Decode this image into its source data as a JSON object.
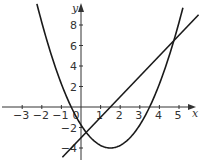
{
  "chart_data": {
    "type": "line",
    "title": "",
    "xlabel": "x",
    "ylabel": "y",
    "xlim": [
      -4,
      6
    ],
    "ylim": [
      -5,
      9.5
    ],
    "grid": false,
    "legend": null,
    "x_ticks": [
      -3,
      -2,
      -1,
      0,
      1,
      2,
      3,
      4,
      5
    ],
    "x_tick_labels": [
      "−3",
      "−2",
      "−1",
      "0",
      "1",
      "2",
      "3",
      "4",
      "5"
    ],
    "y_ticks": [
      -4,
      -2,
      2,
      4,
      6,
      8
    ],
    "y_tick_labels": [
      "−4",
      "−2",
      "2",
      "4",
      "6",
      "8"
    ],
    "series": [
      {
        "name": "parabola",
        "equation": "y = x^2 - 3x - 1.75",
        "x_range": [
          -2.25,
          5.2
        ],
        "roots": [
          -0.5,
          3.5
        ],
        "vertex": [
          1.5,
          -4
        ],
        "y_intercept": -1.75
      },
      {
        "name": "line",
        "equation": "y = 2x - 3",
        "x_range": [
          -0.95,
          6.0
        ],
        "y_intercept": -3,
        "slope": 2
      }
    ],
    "intersections": [
      [
        0.26,
        -2.47
      ],
      [
        4.74,
        6.47
      ]
    ]
  },
  "colors": {
    "curve": "#1a1a1a",
    "axis": "#333333"
  }
}
